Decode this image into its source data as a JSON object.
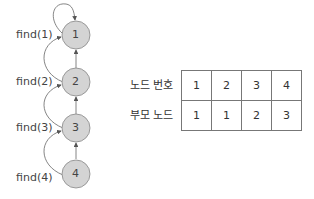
{
  "diagram": {
    "nodes": [
      {
        "id": "1",
        "label": "1"
      },
      {
        "id": "2",
        "label": "2"
      },
      {
        "id": "3",
        "label": "3"
      },
      {
        "id": "4",
        "label": "4"
      }
    ],
    "find_labels": [
      "find(1)",
      "find(2)",
      "find(3)",
      "find(4)"
    ],
    "edges": [
      {
        "from": "1",
        "to": "1",
        "type": "self-loop"
      },
      {
        "from": "2",
        "to": "1",
        "type": "parent"
      },
      {
        "from": "3",
        "to": "2",
        "type": "parent"
      },
      {
        "from": "4",
        "to": "3",
        "type": "parent"
      },
      {
        "from": "find(2)",
        "to": "1",
        "type": "find-path"
      },
      {
        "from": "find(3)",
        "to": "2",
        "type": "find-path"
      },
      {
        "from": "find(4)",
        "to": "3",
        "type": "find-path"
      }
    ],
    "colors": {
      "node_fill": "#d4d4d4",
      "node_stroke": "#888888",
      "edge": "#666666"
    }
  },
  "table": {
    "rows": [
      {
        "header": "노드 번호",
        "cells": [
          "1",
          "2",
          "3",
          "4"
        ]
      },
      {
        "header": "부모 노드",
        "cells": [
          "1",
          "1",
          "2",
          "3"
        ]
      }
    ]
  }
}
